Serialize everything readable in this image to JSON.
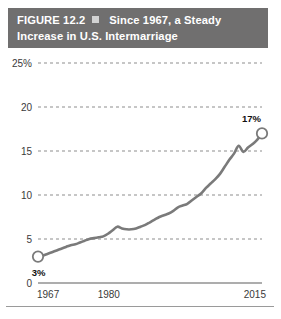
{
  "figure": {
    "label": "FIGURE 12.2",
    "separator_icon": "square-bullet-icon",
    "title_line1": "Since 1967, a Steady",
    "title_line2": "Increase in U.S. Intermarriage",
    "bar_color": "#706f6f"
  },
  "chart_data": {
    "type": "line",
    "title": "Since 1967, a Steady Increase in U.S. Intermarriage",
    "xlabel": "",
    "ylabel": "",
    "xlim": [
      1967,
      2015
    ],
    "ylim": [
      0,
      25
    ],
    "grid": true,
    "legend": false,
    "line_color": "#7a7a7a",
    "ytick_labels": [
      "25%",
      "20",
      "15",
      "10",
      "5",
      "0"
    ],
    "ytick_values": [
      25,
      20,
      15,
      10,
      5,
      0
    ],
    "xtick_labels": [
      "1967",
      "1980",
      "2015"
    ],
    "xtick_values": [
      1967,
      1980,
      2015
    ],
    "annotations": [
      {
        "name": "start-value",
        "text": "3%",
        "x": 1967,
        "y": 3
      },
      {
        "name": "end-value",
        "text": "17%",
        "x": 2015,
        "y": 17
      }
    ],
    "markers": [
      {
        "x": 1967,
        "y": 3,
        "style": "open-circle"
      },
      {
        "x": 2015,
        "y": 17,
        "style": "open-circle"
      }
    ],
    "x": [
      1967,
      1968,
      1969,
      1970,
      1971,
      1972,
      1973,
      1974,
      1975,
      1976,
      1977,
      1978,
      1979,
      1980,
      1981,
      1982,
      1983,
      1984,
      1985,
      1986,
      1987,
      1988,
      1989,
      1990,
      1991,
      1992,
      1993,
      1994,
      1995,
      1996,
      1997,
      1998,
      1999,
      2000,
      2001,
      2002,
      2003,
      2004,
      2005,
      2006,
      2007,
      2008,
      2009,
      2010,
      2011,
      2012,
      2013,
      2014,
      2015
    ],
    "values": [
      3.0,
      3.1,
      3.3,
      3.5,
      3.7,
      3.9,
      4.1,
      4.3,
      4.4,
      4.6,
      4.8,
      5.0,
      5.1,
      5.2,
      5.3,
      5.6,
      6.0,
      6.4,
      6.2,
      6.1,
      6.1,
      6.2,
      6.4,
      6.6,
      6.9,
      7.2,
      7.5,
      7.7,
      7.9,
      8.2,
      8.6,
      8.8,
      9.0,
      9.4,
      9.8,
      10.2,
      10.8,
      11.3,
      11.8,
      12.4,
      13.2,
      14.0,
      14.7,
      15.6,
      14.9,
      15.4,
      15.8,
      16.3,
      17.0
    ]
  }
}
